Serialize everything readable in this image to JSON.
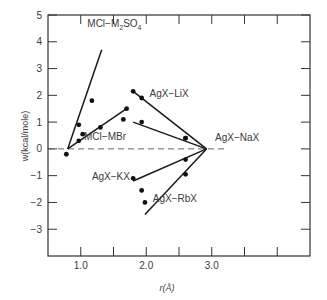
{
  "chart_data": {
    "type": "scatter",
    "title": "",
    "xlabel": "r(Å)",
    "ylabel": "w(kcal/mole)",
    "xlim": [
      0.5,
      4.5
    ],
    "ylim": [
      -4,
      5
    ],
    "x_ticks": [
      1.0,
      1.5,
      2.0,
      2.5,
      3.0,
      3.5,
      4.0
    ],
    "x_tick_labels": [
      {
        "value": 1.0,
        "label": "1.0"
      },
      {
        "value": 2.0,
        "label": "2.0"
      },
      {
        "value": 3.0,
        "label": "3.0"
      }
    ],
    "y_ticks": [
      5,
      4,
      3,
      2,
      1,
      0,
      -1,
      -2,
      -3
    ],
    "y_tick_labels": [
      "5",
      "4",
      "3",
      "2",
      "1",
      "0",
      "−1",
      "−2",
      "−3"
    ],
    "grid": false,
    "legend": "inline labels",
    "reference_line": {
      "y": 0,
      "style": "dashed",
      "x_range": [
        0.5,
        3.2
      ]
    },
    "series": [
      {
        "name": "MCl−M2SO4",
        "label_text": "MCl−M",
        "label_sub": "2",
        "label_mid": "SO",
        "label_sub2": "4",
        "label_pos": [
          1.1,
          4.55
        ],
        "line": [
          [
            0.8,
            0.0
          ],
          [
            1.32,
            3.7
          ]
        ],
        "points": [
          [
            0.97,
            0.9
          ],
          [
            1.17,
            1.8
          ]
        ]
      },
      {
        "name": "MCl−MBr",
        "label_text": "MCl−MBr",
        "label_pos": [
          1.05,
          0.32
        ],
        "line": [
          [
            0.8,
            0.0
          ],
          [
            1.7,
            1.5
          ]
        ],
        "points": [
          [
            0.78,
            -0.2
          ],
          [
            0.97,
            0.3
          ],
          [
            1.03,
            0.55
          ],
          [
            1.3,
            0.8
          ],
          [
            1.65,
            1.1
          ],
          [
            1.7,
            1.5
          ]
        ]
      },
      {
        "name": "AgX−LiX",
        "label_text": "AgX−LiX",
        "label_pos": [
          2.05,
          1.95
        ],
        "line": [
          [
            1.8,
            2.15
          ],
          [
            2.92,
            0.0
          ]
        ],
        "points": [
          [
            1.8,
            2.15
          ],
          [
            1.93,
            1.9
          ],
          [
            2.6,
            0.4
          ]
        ]
      },
      {
        "name": "AgX−NaX",
        "label_text": "AgX−NaX",
        "label_pos": [
          3.05,
          0.3
        ],
        "line": [
          [
            1.8,
            1.0
          ],
          [
            2.92,
            0.0
          ]
        ],
        "points": [
          [
            1.93,
            1.0
          ],
          [
            2.6,
            0.4
          ]
        ]
      },
      {
        "name": "AgX−KX",
        "label_text": "AgX−KX",
        "label_pos": [
          1.17,
          -1.18
        ],
        "line": [
          [
            1.8,
            -1.2
          ],
          [
            2.92,
            0.0
          ]
        ],
        "points": [
          [
            1.8,
            -1.1
          ],
          [
            1.93,
            -1.55
          ],
          [
            1.98,
            -2.0
          ],
          [
            2.6,
            -0.4
          ]
        ]
      },
      {
        "name": "AgX−RbX",
        "label_text": "AgX−RbX",
        "label_pos": [
          2.1,
          -2.0
        ],
        "line": [
          [
            1.98,
            -2.45
          ],
          [
            2.92,
            0.0
          ]
        ],
        "points": [
          [
            2.6,
            -0.95
          ]
        ]
      }
    ]
  },
  "plot": {
    "frame": {
      "left": 48,
      "top": 15,
      "right": 310,
      "bottom": 256
    }
  }
}
